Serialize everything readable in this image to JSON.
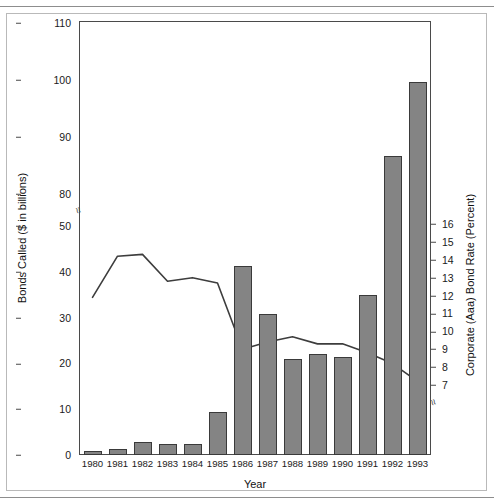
{
  "chart_data": {
    "type": "bar",
    "title": "",
    "xlabel": "Year",
    "ylabel": "Bonds Called ($ in billions)",
    "ylabel_right": "Corporate (Aaa) Bond Rate (Percent)",
    "categories": [
      "1980",
      "1981",
      "1982",
      "1983",
      "1984",
      "1985",
      "1986",
      "1987",
      "1988",
      "1989",
      "1990",
      "1991",
      "1992",
      "1993"
    ],
    "yticks_left": [
      "0",
      "10",
      "20",
      "30",
      "40",
      "50",
      "80",
      "90",
      "100",
      "110"
    ],
    "yticks_right": [
      "7",
      "8",
      "9",
      "10",
      "11",
      "12",
      "13",
      "14",
      "15",
      "16"
    ],
    "ylim": [
      0,
      110
    ],
    "ylim_right": [
      6.2,
      16.8
    ],
    "axis_break_left": true,
    "axis_break_right": true,
    "grid": false,
    "legend": "none",
    "series": [
      {
        "name": "Bonds Called ($ in billions)",
        "type": "bar",
        "axis": "left",
        "color": "#848484",
        "values": [
          0.9,
          1.3,
          2.9,
          2.4,
          2.5,
          9.3,
          41.2,
          30.8,
          21.0,
          22.0,
          21.5,
          35.0,
          86.7,
          99.7
        ]
      },
      {
        "name": "Corporate (Aaa) Bond Rate (Percent)",
        "type": "line",
        "axis": "right",
        "color": "#3d3d3d",
        "values": [
          11.9,
          14.2,
          14.3,
          12.8,
          13.0,
          12.7,
          9.0,
          9.4,
          9.7,
          9.3,
          9.3,
          8.8,
          8.2,
          7.2
        ]
      }
    ]
  }
}
